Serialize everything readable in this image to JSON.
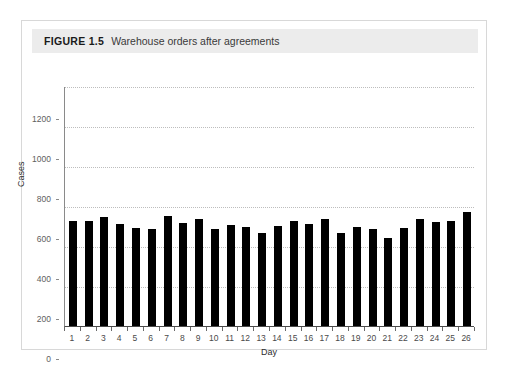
{
  "figure": {
    "label": "FIGURE 1.5",
    "caption": "Warehouse orders after agreements",
    "banner_color": "#ececec",
    "card_border_color": "#d8d8d8"
  },
  "chart_data": {
    "type": "bar",
    "title": "Warehouse orders after agreements",
    "xlabel": "Day",
    "ylabel": "Cases",
    "categories": [
      "1",
      "2",
      "3",
      "4",
      "5",
      "6",
      "7",
      "8",
      "9",
      "10",
      "11",
      "12",
      "13",
      "14",
      "15",
      "16",
      "17",
      "18",
      "19",
      "20",
      "21",
      "22",
      "23",
      "24",
      "25",
      "26"
    ],
    "values": [
      525,
      525,
      545,
      508,
      492,
      483,
      550,
      517,
      537,
      487,
      503,
      493,
      467,
      498,
      527,
      508,
      535,
      465,
      497,
      487,
      440,
      492,
      535,
      520,
      523,
      570
    ],
    "ylim": [
      0,
      1200
    ],
    "ytick_values": [
      0,
      200,
      400,
      600,
      800,
      1000,
      1200
    ],
    "ytick_labels": [
      "0",
      "200",
      "400",
      "600",
      "800",
      "1000",
      "1200"
    ],
    "grid": "horizontal-dotted",
    "legend": "none",
    "bar_color": "#000000",
    "gridline_color": "#bdbdbd"
  }
}
